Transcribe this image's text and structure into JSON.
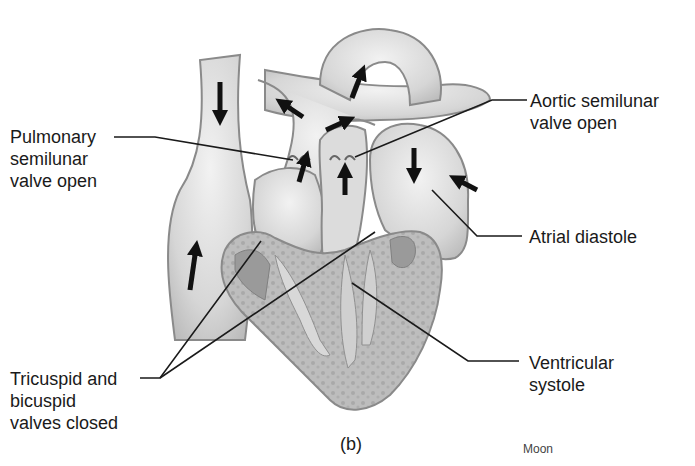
{
  "diagram": {
    "labels": {
      "pulmonary_valve": "Pulmonary\nsemilunar\nvalve open",
      "aortic_valve": "Aortic semilunar\nvalve open",
      "atrial_diastole": "Atrial diastole",
      "ventricular_systole": "Ventricular\nsystole",
      "av_valves": "Tricuspid and\nbicuspid\nvalves closed"
    },
    "panel_caption": "(b)",
    "credit": "Moon",
    "colors": {
      "ink": "#1a1a1a",
      "vessel_fill": "#e2e2e2",
      "vessel_shade": "#bdbdbd",
      "muscle_fill": "#b8b8b8",
      "chamber_dark": "#9a9a9a",
      "arrow": "#111111"
    }
  }
}
